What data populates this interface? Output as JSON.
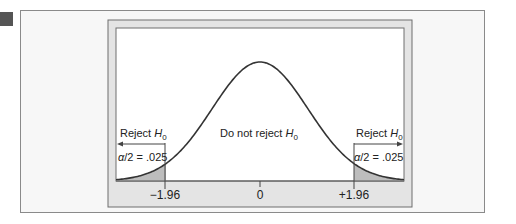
{
  "chart_data": {
    "type": "area",
    "title": "",
    "xlabel": "",
    "ylabel": "",
    "x_ticks": [
      "−1.96",
      "0",
      "+1.96"
    ],
    "x_tick_values": [
      -1.96,
      0,
      1.96
    ],
    "xlim": [
      -3.2,
      3.2
    ],
    "curve": "standard normal density",
    "shaded_regions": [
      {
        "from": -3.2,
        "to": -1.96,
        "label": "α/2 = .025"
      },
      {
        "from": 1.96,
        "to": 3.2,
        "label": "α/2 = .025"
      }
    ],
    "annotations": {
      "left_region": "Reject H0",
      "center_region": "Do not reject H0",
      "right_region": "Reject H0",
      "left_alpha": "α/2 = .025",
      "right_alpha": "α/2 = .025"
    },
    "grid": false,
    "legend": "none"
  },
  "labels": {
    "reject_left_text": "Reject ",
    "reject_right_text": "Reject ",
    "do_not_reject_text": "Do not reject ",
    "h_symbol": "H",
    "h_subscript": "0",
    "alpha_symbol": "α",
    "alpha_rest": "/2 = .025",
    "tick_left": "−1.96",
    "tick_center": "0",
    "tick_right": "+1.96"
  },
  "colors": {
    "curve": "#333333",
    "shade": "#bdbdbd",
    "frame": "#e6e6e6",
    "frame_border": "#6e6e6e",
    "panel_bg": "#f7f7f7"
  }
}
